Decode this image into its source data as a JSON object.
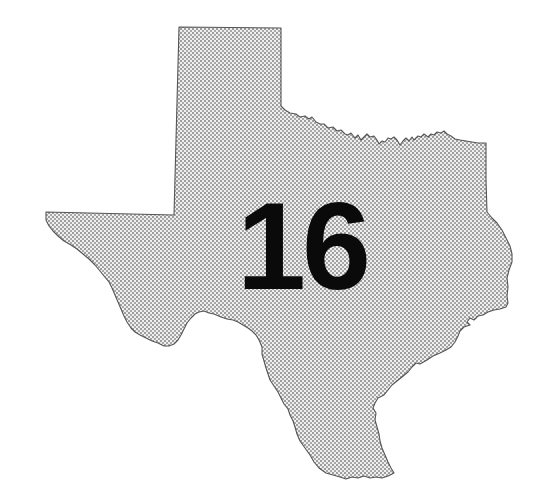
{
  "map": {
    "region": "Texas",
    "label": "16",
    "colors": {
      "background": "#ffffff",
      "fill_base": "#efefef",
      "dot": "#7a7a7a",
      "outline": "#555555",
      "label": "#0a0a0a"
    }
  }
}
